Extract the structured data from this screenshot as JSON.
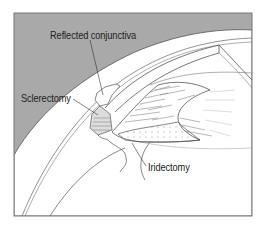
{
  "figure": {
    "background_color": "#a9a9a9",
    "line_color": "#555555",
    "frame_color": "#777777"
  },
  "labels": {
    "reflected_conjunctiva": "Reflected conjunctiva",
    "sclerectomy": "Sclerectomy",
    "iridectomy": "Iridectomy"
  }
}
